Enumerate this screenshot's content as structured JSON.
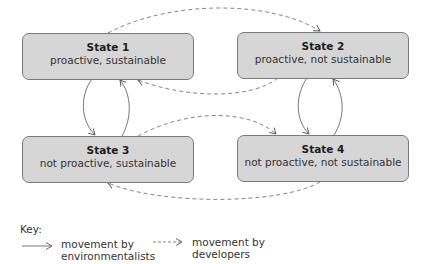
{
  "states": [
    {
      "id": 1,
      "title": "State 1",
      "subtitle": "proactive, sustainable"
    },
    {
      "id": 2,
      "title": "State 2",
      "subtitle": "proactive, not sustainable"
    },
    {
      "id": 3,
      "title": "State 3",
      "subtitle": "not proactive, sustainable"
    },
    {
      "id": 4,
      "title": "State 4",
      "subtitle": "not proactive, not sustainable"
    }
  ],
  "transitions": [
    {
      "from": 1,
      "to": 2,
      "by": "developers",
      "style": "dashed"
    },
    {
      "from": 2,
      "to": 1,
      "by": "developers",
      "style": "dashed"
    },
    {
      "from": 3,
      "to": 4,
      "by": "developers",
      "style": "dashed"
    },
    {
      "from": 4,
      "to": 3,
      "by": "developers",
      "style": "dashed"
    },
    {
      "from": 1,
      "to": 3,
      "by": "environmentalists",
      "style": "solid"
    },
    {
      "from": 3,
      "to": 1,
      "by": "environmentalists",
      "style": "solid"
    },
    {
      "from": 2,
      "to": 4,
      "by": "environmentalists",
      "style": "solid"
    },
    {
      "from": 4,
      "to": 2,
      "by": "environmentalists",
      "style": "solid"
    }
  ],
  "key": {
    "label": "Key:",
    "solid": {
      "line1": "movement by",
      "line2": "environmentalists"
    },
    "dashed": {
      "line1": "movement by",
      "line2": "developers"
    }
  },
  "colors": {
    "box_fill": "#d6d6d6",
    "box_border": "#7a7a7a",
    "arrow": "#666666"
  }
}
